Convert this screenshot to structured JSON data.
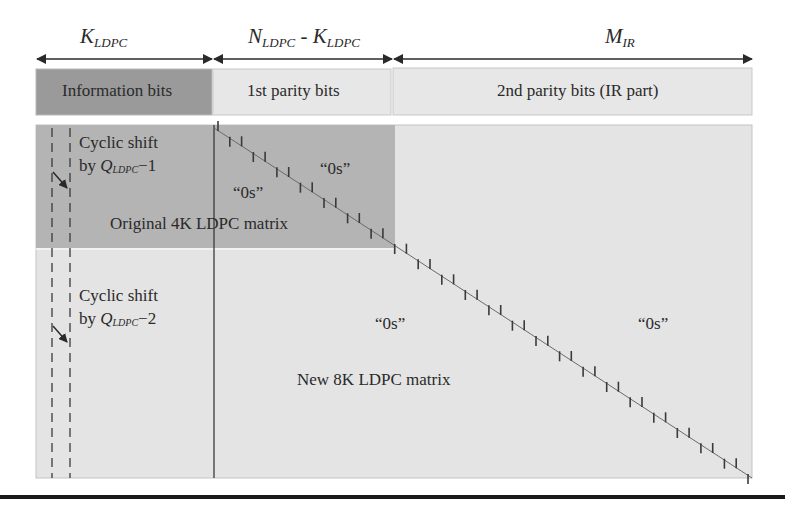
{
  "dimensions": {
    "k_ldpc": {
      "base": "K",
      "sub": "LDPC"
    },
    "n_minus_k": {
      "n_base": "N",
      "n_sub": "LDPC",
      "sep": " - ",
      "k_base": "K",
      "k_sub": "LDPC"
    },
    "m_ir": {
      "base": "M",
      "sub": "IR"
    }
  },
  "segments": {
    "information": "Information bits",
    "first_parity": "1st parity bits",
    "second_parity": "2nd parity bits (IR part)"
  },
  "matrix": {
    "shift1": {
      "line1": "Cyclic shift",
      "by": "by ",
      "q": "Q",
      "sub": "LDPC",
      "suffix": "−1"
    },
    "shift2": {
      "line1": "Cyclic shift",
      "by": "by ",
      "q": "Q",
      "sub": "LDPC",
      "suffix": "−2"
    },
    "zeros_upper_right": "“0s”",
    "zeros_upper_left": "“0s”",
    "original_label": "Original 4K LDPC matrix",
    "zeros_lower_middle": "“0s”",
    "zeros_lower_right": "“0s”",
    "new_label": "New 8K LDPC matrix"
  },
  "colors": {
    "info_fill": "#9a9a9a",
    "parity_fill": "#e6e6e6",
    "original_region": "#b4b4b4",
    "matrix_fill": "#e4e4e4",
    "line": "#3a3a3a"
  }
}
